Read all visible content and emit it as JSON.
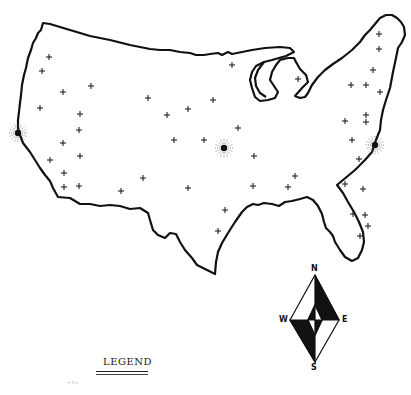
{
  "map": {
    "title": "United States outline map",
    "outline_color": "#111111",
    "background": "#ffffff",
    "major_cities": [
      {
        "name": "west-coast-city",
        "x": 18,
        "y": 133
      },
      {
        "name": "central-city",
        "x": 224,
        "y": 148
      },
      {
        "name": "east-coast-city",
        "x": 375,
        "y": 145
      }
    ],
    "minor_cities": [
      [
        49,
        57
      ],
      [
        42,
        71
      ],
      [
        63,
        92
      ],
      [
        91,
        86
      ],
      [
        148,
        98
      ],
      [
        232,
        65
      ],
      [
        298,
        79
      ],
      [
        379,
        34
      ],
      [
        379,
        49
      ],
      [
        373,
        70
      ],
      [
        351,
        85
      ],
      [
        366,
        85
      ],
      [
        380,
        92
      ],
      [
        366,
        115
      ],
      [
        345,
        121
      ],
      [
        366,
        122
      ],
      [
        352,
        140
      ],
      [
        359,
        159
      ],
      [
        345,
        184
      ],
      [
        363,
        189
      ],
      [
        353,
        214
      ],
      [
        365,
        215
      ],
      [
        368,
        226
      ],
      [
        360,
        236
      ],
      [
        188,
        109
      ],
      [
        167,
        115
      ],
      [
        213,
        100
      ],
      [
        238,
        128
      ],
      [
        174,
        140
      ],
      [
        204,
        140
      ],
      [
        254,
        156
      ],
      [
        295,
        176
      ],
      [
        288,
        187
      ],
      [
        253,
        186
      ],
      [
        188,
        188
      ],
      [
        225,
        210
      ],
      [
        218,
        231
      ],
      [
        143,
        178
      ],
      [
        121,
        191
      ],
      [
        80,
        114
      ],
      [
        79,
        130
      ],
      [
        63,
        143
      ],
      [
        80,
        156
      ],
      [
        50,
        160
      ],
      [
        64,
        173
      ],
      [
        64,
        187
      ],
      [
        79,
        186
      ],
      [
        40,
        108
      ]
    ]
  },
  "legend": {
    "title": "LEGEND",
    "note": "+ 5 s"
  },
  "compass": {
    "north": "N",
    "south": "S",
    "east": "E",
    "west": "W"
  }
}
